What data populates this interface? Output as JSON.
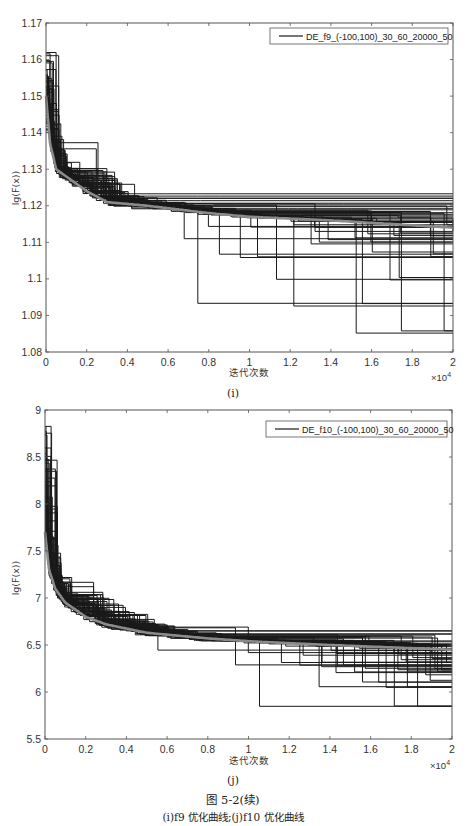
{
  "chart_data": [
    {
      "type": "line",
      "panel": "(i)",
      "title": "",
      "xlabel": "迭代次数",
      "ylabel": "lg(F(x))",
      "x_multiplier": "×10^4",
      "xlim": [
        0,
        2
      ],
      "ylim": [
        1.08,
        1.17
      ],
      "xticks": [
        "0",
        "0.2",
        "0.4",
        "0.6",
        "0.8",
        "1",
        "1.2",
        "1.4",
        "1.6",
        "1.8",
        "2"
      ],
      "yticks": [
        "1.08",
        "1.09",
        "1.1",
        "1.11",
        "1.12",
        "1.13",
        "1.14",
        "1.15",
        "1.16",
        "1.17"
      ],
      "grid": false,
      "legend": {
        "position": "top-right",
        "entries": [
          "DE_f9_(-100,100)_30_60_20000_50"
        ]
      },
      "series": [
        {
          "name": "DE_f9_(-100,100)_30_60_20000_50",
          "description": "50 stepwise best-fitness runs (black)",
          "start_range": [
            1.14,
            1.163
          ],
          "final_values": [
            1.0855,
            1.093,
            1.1,
            1.106,
            1.107,
            1.11,
            1.111,
            1.112,
            1.113,
            1.114,
            1.115,
            1.116,
            1.117,
            1.118,
            1.119,
            1.12,
            1.121,
            1.122,
            1.123
          ]
        },
        {
          "name": "mean",
          "description": "mean convergence curve (gray)",
          "x": [
            0,
            0.02,
            0.05,
            0.1,
            0.2,
            0.3,
            0.5,
            0.8,
            1.0,
            1.4,
            2.0
          ],
          "values": [
            1.15,
            1.137,
            1.13,
            1.128,
            1.124,
            1.121,
            1.12,
            1.118,
            1.117,
            1.116,
            1.114
          ]
        }
      ]
    },
    {
      "type": "line",
      "panel": "(j)",
      "title": "",
      "xlabel": "迭代次数",
      "ylabel": "lg(F(x))",
      "x_multiplier": "×10^4",
      "xlim": [
        0,
        2
      ],
      "ylim": [
        5.5,
        9
      ],
      "xticks": [
        "0",
        "0.2",
        "0.4",
        "0.6",
        "0.8",
        "1",
        "1.2",
        "1.4",
        "1.6",
        "1.8",
        "2"
      ],
      "yticks": [
        "5.5",
        "6",
        "6.5",
        "7",
        "7.5",
        "8",
        "8.5",
        "9"
      ],
      "grid": false,
      "legend": {
        "position": "top-right",
        "entries": [
          "DE_f10_(-100,100)_30_60_20000_50"
        ]
      },
      "series": [
        {
          "name": "DE_f10_(-100,100)_30_60_20000_50",
          "description": "50 stepwise best-fitness runs (black)",
          "start_range": [
            7.5,
            8.85
          ],
          "final_values": [
            5.85,
            6.05,
            6.12,
            6.2,
            6.22,
            6.25,
            6.28,
            6.3,
            6.33,
            6.36,
            6.4,
            6.42,
            6.45,
            6.48,
            6.5,
            6.52,
            6.55,
            6.6,
            6.65
          ]
        },
        {
          "name": "mean",
          "description": "mean convergence curve (gray)",
          "x": [
            0,
            0.02,
            0.05,
            0.1,
            0.2,
            0.3,
            0.5,
            0.8,
            1.0,
            1.4,
            2.0
          ],
          "values": [
            7.7,
            7.3,
            7.1,
            6.95,
            6.8,
            6.72,
            6.63,
            6.57,
            6.54,
            6.5,
            6.45
          ]
        }
      ]
    }
  ],
  "panels": [
    {
      "id": "i",
      "sub_label": "(i)",
      "legend_label": "DE_f9_(-100,100)_30_60_20000_50",
      "xlabel": "迭代次数",
      "ylabel": "lg(F(x))",
      "x_exponent_base": "×10",
      "x_exponent_power": "4"
    },
    {
      "id": "j",
      "sub_label": "(j)",
      "legend_label": "DE_f10_(-100,100)_30_60_20000_50",
      "xlabel": "迭代次数",
      "ylabel": "lg(F(x))",
      "x_exponent_base": "×10",
      "x_exponent_power": "4"
    }
  ],
  "figure": {
    "title": "图 5-2(续)",
    "note": "(i)f9 优化曲线;(j)f10 优化曲线"
  },
  "colors": {
    "runs": "#1a1a1a",
    "mean": "#8a8a8a",
    "axis": "#555555",
    "background": "#ffffff"
  }
}
